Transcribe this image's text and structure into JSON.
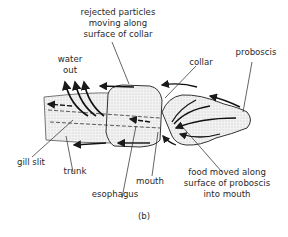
{
  "figure": {
    "panel_label": "(b)",
    "labels": {
      "rejected_particles": [
        "rejected particles",
        "moving along",
        "surface of collar"
      ],
      "water_out": [
        "water",
        "out"
      ],
      "collar": "collar",
      "proboscis": "proboscis",
      "gill_slit": "gill slit",
      "trunk": "trunk",
      "esophagus": "esophagus",
      "mouth": "mouth",
      "food_moved": [
        "food moved along",
        "surface of proboscis",
        "into mouth"
      ]
    }
  }
}
